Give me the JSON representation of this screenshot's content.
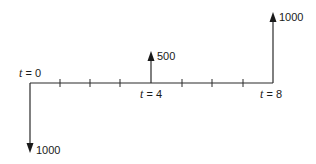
{
  "diagram": {
    "type": "cash-flow-timeline",
    "periods": 8,
    "time_labels": [
      {
        "var": "t",
        "eq": " = 0",
        "period": 0
      },
      {
        "var": "t",
        "eq": " = 4",
        "period": 4
      },
      {
        "var": "t",
        "eq": " = 8",
        "period": 8
      }
    ],
    "cash_flows": [
      {
        "period": 0,
        "direction": "down",
        "amount": "1000"
      },
      {
        "period": 4,
        "direction": "up",
        "amount": "500"
      },
      {
        "period": 8,
        "direction": "up",
        "amount": "1000"
      }
    ]
  }
}
